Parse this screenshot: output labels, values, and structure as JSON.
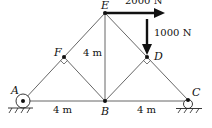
{
  "diagram": {
    "type": "truss",
    "nodes": {
      "A": {
        "label": "A"
      },
      "B": {
        "label": "B"
      },
      "C": {
        "label": "C"
      },
      "D": {
        "label": "D"
      },
      "E": {
        "label": "E"
      },
      "F": {
        "label": "F"
      }
    },
    "members": [
      "A-B",
      "B-C",
      "A-F",
      "F-E",
      "E-D",
      "D-C",
      "F-B",
      "E-B",
      "D-B"
    ],
    "supports": {
      "A": "pin",
      "C": "roller"
    },
    "dimensions": {
      "AB": "4 m",
      "BC": "4 m",
      "height_EB": "4 m"
    },
    "loads": {
      "horizontal": {
        "node": "E",
        "label": "2000 N",
        "direction": "right"
      },
      "vertical": {
        "node": "D",
        "label": "1000 N",
        "direction": "down"
      }
    },
    "colors": {
      "line": "#555555",
      "arrow": "#111111",
      "text": "#111111"
    }
  }
}
